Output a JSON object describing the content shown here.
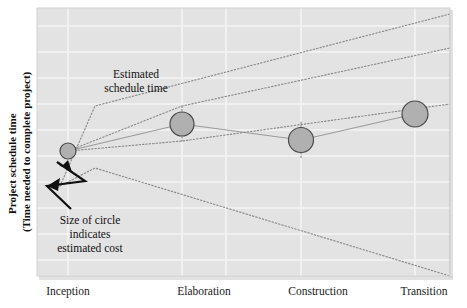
{
  "figure": {
    "width": 467,
    "height": 308,
    "background": "#ffffff",
    "plot": {
      "x": 37,
      "y": 8,
      "width": 413,
      "height": 268,
      "fill": "#e3e3e3",
      "gridline_color": "#f4f4f4"
    }
  },
  "axes": {
    "y_title_line1": "Project schedule time",
    "y_title_line2": "(Time needed to complete project)",
    "x_title": ""
  },
  "annotations": {
    "estimated_schedule": {
      "line1": "Estimated",
      "line2": "schedule time"
    },
    "circle_size": {
      "line1": "Size of circle",
      "line2": "indicates",
      "line3": "estimated cost"
    }
  },
  "colors": {
    "circle_fill": "#b0b0b0",
    "circle_stroke": "#4a4a4a",
    "band_line": "#8a8a8a",
    "center_line": "#9a9a9a",
    "plot_bg": "#e3e3e3",
    "grid": "#f4f4f4",
    "text": "#111111"
  },
  "chart_data": {
    "type": "scatter",
    "title": "",
    "xlabel": "",
    "ylabel": "Project schedule time (Time needed to complete project)",
    "categories": [
      "Inception",
      "Elaboration",
      "Construction",
      "Transition"
    ],
    "x": [
      68,
      182,
      301,
      415
    ],
    "y_center": [
      151,
      124,
      140,
      114
    ],
    "marker_radius": [
      8,
      12,
      12.5,
      13
    ],
    "marker_meaning": "Size of circle indicates estimated cost",
    "grid": true,
    "legend": "none",
    "series": [
      {
        "name": "Estimated schedule time (mid estimate)",
        "style": "solid-thin",
        "points": [
          [
            68,
            151
          ],
          [
            182,
            124
          ],
          [
            301,
            140
          ],
          [
            415,
            114
          ]
        ]
      },
      {
        "name": "Upper uncertainty bound",
        "style": "dotted",
        "points": [
          [
            60,
            186
          ],
          [
            95,
            106
          ],
          [
            450,
            14
          ]
        ]
      },
      {
        "name": "Upper uncertainty bound 2",
        "style": "dotted",
        "points": [
          [
            68,
            151
          ],
          [
            182,
            106
          ],
          [
            450,
            48
          ]
        ]
      },
      {
        "name": "Lower uncertainty bound",
        "style": "dotted",
        "points": [
          [
            68,
            151
          ],
          [
            182,
            141
          ],
          [
            450,
            104
          ]
        ]
      },
      {
        "name": "Lower uncertainty bound 2",
        "style": "dotted",
        "points": [
          [
            60,
            186
          ],
          [
            95,
            168
          ],
          [
            450,
            276
          ]
        ]
      },
      {
        "name": "Uncertainty funnel - elaboration",
        "style": "dotted",
        "points": [
          [
            182,
            106
          ],
          [
            182,
            141
          ]
        ]
      },
      {
        "name": "Uncertainty funnel - construction",
        "style": "dotted",
        "points": [
          [
            301,
            122
          ],
          [
            301,
            158
          ]
        ]
      },
      {
        "name": "Uncertainty funnel - transition",
        "style": "dotted",
        "points": [
          [
            415,
            104
          ],
          [
            415,
            126
          ]
        ]
      }
    ],
    "x_gridlines": [
      68,
      182,
      226,
      301,
      415
    ],
    "y_gridlines": [
      26,
      52,
      78,
      104,
      130,
      156,
      182,
      208,
      234,
      260
    ]
  }
}
